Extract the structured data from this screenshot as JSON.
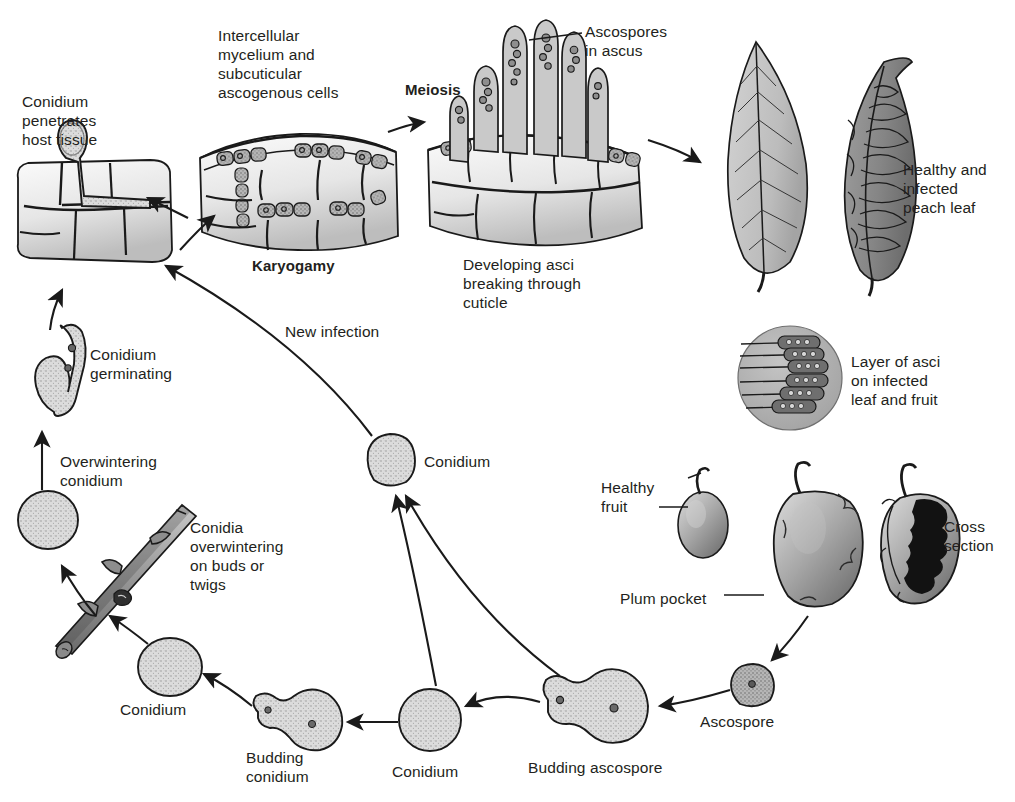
{
  "figure": {
    "background_color": "#ffffff",
    "ink_color": "#231f20"
  },
  "palette": {
    "spore_fill": "#d9d9d9",
    "spore_fill_dark": "#b9b9b9",
    "tissue_fill": "#e3e3e3",
    "tissue_fill_dark": "#c2c2c2",
    "leaf_healthy_fill": "#c6c6c6",
    "leaf_infected_fill": "#8f8f8f",
    "asci_circle_fill": "#b0b0b0",
    "fruit_fill": "#a8a8a8",
    "fruit_dark": "#6a6a6a",
    "twig_fill": "#9a9a9a",
    "outline": "#1a1a1a"
  },
  "labels": [
    {
      "id": "conidium-penetrates",
      "text": "Conidium\npenetrates\nhost tissue",
      "x": 22,
      "y": 92,
      "align": "left",
      "bold": false
    },
    {
      "id": "intercellular-mycelium",
      "text": "Intercellular\nmycelium and\nsubcuticular\nascogenous cells",
      "x": 218,
      "y": 26,
      "align": "left",
      "bold": false
    },
    {
      "id": "karyogamy",
      "text": "Karyogamy",
      "x": 252,
      "y": 256,
      "align": "left",
      "bold": true
    },
    {
      "id": "meiosis",
      "text": "Meiosis",
      "x": 405,
      "y": 80,
      "align": "left",
      "bold": true
    },
    {
      "id": "ascospores-in-ascus",
      "text": "Ascospores\nin ascus",
      "x": 585,
      "y": 22,
      "align": "left",
      "bold": false
    },
    {
      "id": "developing-asci",
      "text": "Developing asci\nbreaking through\ncuticle",
      "x": 463,
      "y": 255,
      "align": "left",
      "bold": false
    },
    {
      "id": "healthy-infected-leaf",
      "text": "Healthy and\ninfected\npeach leaf",
      "x": 903,
      "y": 160,
      "align": "left",
      "bold": false
    },
    {
      "id": "layer-of-asci",
      "text": "Layer of asci\non infected\nleaf and fruit",
      "x": 851,
      "y": 352,
      "align": "left",
      "bold": false
    },
    {
      "id": "new-infection",
      "text": "New infection",
      "x": 285,
      "y": 322,
      "align": "left",
      "bold": false
    },
    {
      "id": "conidium-center",
      "text": "Conidium",
      "x": 424,
      "y": 452,
      "align": "left",
      "bold": false
    },
    {
      "id": "conidium-germinating",
      "text": "Conidium\ngerminating",
      "x": 90,
      "y": 345,
      "align": "left",
      "bold": false
    },
    {
      "id": "overwintering-conidium",
      "text": "Overwintering\nconidium",
      "x": 60,
      "y": 452,
      "align": "left",
      "bold": false
    },
    {
      "id": "conidia-overwintering",
      "text": "Conidia\noverwintering\non buds or\ntwigs",
      "x": 190,
      "y": 518,
      "align": "left",
      "bold": false
    },
    {
      "id": "conidium-lower-left",
      "text": "Conidium",
      "x": 120,
      "y": 700,
      "align": "left",
      "bold": false
    },
    {
      "id": "budding-conidium",
      "text": "Budding\nconidium",
      "x": 246,
      "y": 748,
      "align": "left",
      "bold": false
    },
    {
      "id": "conidium-bottom",
      "text": "Conidium",
      "x": 392,
      "y": 762,
      "align": "left",
      "bold": false
    },
    {
      "id": "budding-ascospore",
      "text": "Budding ascospore",
      "x": 528,
      "y": 758,
      "align": "left",
      "bold": false
    },
    {
      "id": "ascospore",
      "text": "Ascospore",
      "x": 700,
      "y": 712,
      "align": "left",
      "bold": false
    },
    {
      "id": "healthy-fruit",
      "text": "Healthy\nfruit",
      "x": 601,
      "y": 478,
      "align": "left",
      "bold": false
    },
    {
      "id": "plum-pocket",
      "text": "Plum pocket",
      "x": 620,
      "y": 589,
      "align": "left",
      "bold": false
    },
    {
      "id": "cross-section",
      "text": "Cross\nsection",
      "x": 944,
      "y": 517,
      "align": "left",
      "bold": false
    }
  ],
  "stages": [
    {
      "id": "host-tissue-penetration",
      "name": "Conidium penetrates host tissue"
    },
    {
      "id": "ascogenous-cells",
      "name": "Intercellular mycelium and subcuticular ascogenous cells"
    },
    {
      "id": "developing-asci",
      "name": "Developing asci breaking through cuticle"
    },
    {
      "id": "peach-leaves",
      "name": "Healthy and infected peach leaf"
    },
    {
      "id": "asci-layer",
      "name": "Layer of asci on infected leaf and fruit"
    },
    {
      "id": "fruit-group",
      "name": "Healthy fruit, plum pocket, cross section"
    },
    {
      "id": "ascospore",
      "name": "Ascospore"
    },
    {
      "id": "budding-ascospore",
      "name": "Budding ascospore"
    },
    {
      "id": "conidium-bottom",
      "name": "Conidium"
    },
    {
      "id": "budding-conidium",
      "name": "Budding conidium"
    },
    {
      "id": "conidium-lower-left",
      "name": "Conidium"
    },
    {
      "id": "twig",
      "name": "Conidia overwintering on buds or twigs"
    },
    {
      "id": "overwintering-conidium",
      "name": "Overwintering conidium"
    },
    {
      "id": "germinating-conidium",
      "name": "Conidium germinating"
    },
    {
      "id": "conidium-center",
      "name": "Conidium"
    }
  ]
}
